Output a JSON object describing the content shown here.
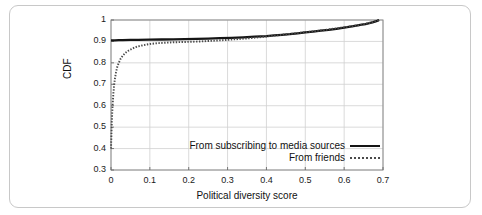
{
  "chart_data": {
    "type": "line",
    "title": "",
    "subtitle": "",
    "xlabel": "Political diversity score",
    "ylabel": "CDF",
    "xlim": [
      0,
      0.7
    ],
    "ylim": [
      0.3,
      1.0
    ],
    "grid": true,
    "legend_position": "inside-bottom-right",
    "xticks": [
      "0",
      "0.1",
      "0.2",
      "0.3",
      "0.4",
      "0.5",
      "0.6",
      "0.7"
    ],
    "xtick_values": [
      0,
      0.1,
      0.2,
      0.3,
      0.4,
      0.5,
      0.6,
      0.7
    ],
    "yticks": [
      "0.3",
      "0.4",
      "0.5",
      "0.6",
      "0.7",
      "0.8",
      "0.9",
      "1"
    ],
    "ytick_values": [
      0.3,
      0.4,
      0.5,
      0.6,
      0.7,
      0.8,
      0.9,
      1.0
    ],
    "series": [
      {
        "name": "From subscribing to media sources",
        "style": "solid",
        "color": "#151515",
        "x": [
          0.0,
          0.005,
          0.01,
          0.02,
          0.03,
          0.05,
          0.07,
          0.1,
          0.13,
          0.16,
          0.19,
          0.22,
          0.25,
          0.28,
          0.31,
          0.34,
          0.37,
          0.4,
          0.42,
          0.44,
          0.46,
          0.48,
          0.5,
          0.52,
          0.54,
          0.56,
          0.58,
          0.6,
          0.62,
          0.635,
          0.645,
          0.655,
          0.665,
          0.675,
          0.685,
          0.69
        ],
        "y": [
          0.905,
          0.905,
          0.905,
          0.906,
          0.906,
          0.907,
          0.907,
          0.908,
          0.909,
          0.91,
          0.911,
          0.912,
          0.913,
          0.915,
          0.917,
          0.919,
          0.922,
          0.925,
          0.928,
          0.931,
          0.934,
          0.938,
          0.942,
          0.946,
          0.95,
          0.954,
          0.959,
          0.964,
          0.97,
          0.975,
          0.978,
          0.981,
          0.985,
          0.99,
          0.996,
          1.0
        ]
      },
      {
        "name": "From friends",
        "style": "dotted",
        "color": "#4a4a4a",
        "x": [
          0.0,
          0.002,
          0.004,
          0.006,
          0.008,
          0.01,
          0.013,
          0.016,
          0.02,
          0.025,
          0.03,
          0.036,
          0.043,
          0.05,
          0.06,
          0.07,
          0.08,
          0.09,
          0.1,
          0.12,
          0.14,
          0.16,
          0.18,
          0.2,
          0.23,
          0.26,
          0.29,
          0.32,
          0.35,
          0.38,
          0.4,
          0.42,
          0.44,
          0.46,
          0.48,
          0.5,
          0.52,
          0.54,
          0.56,
          0.58,
          0.6,
          0.62,
          0.635,
          0.645,
          0.655,
          0.665,
          0.675,
          0.685,
          0.69
        ],
        "y": [
          0.4,
          0.52,
          0.6,
          0.655,
          0.695,
          0.725,
          0.757,
          0.78,
          0.8,
          0.82,
          0.833,
          0.845,
          0.855,
          0.862,
          0.871,
          0.877,
          0.881,
          0.885,
          0.888,
          0.892,
          0.894,
          0.896,
          0.897,
          0.898,
          0.9,
          0.903,
          0.906,
          0.91,
          0.914,
          0.919,
          0.923,
          0.927,
          0.931,
          0.935,
          0.939,
          0.943,
          0.947,
          0.951,
          0.956,
          0.961,
          0.966,
          0.971,
          0.975,
          0.978,
          0.982,
          0.986,
          0.991,
          0.996,
          1.0
        ]
      }
    ]
  },
  "legend": {
    "items": [
      {
        "label": "From subscribing to media sources",
        "style": "solid"
      },
      {
        "label": "From friends",
        "style": "dotted"
      }
    ]
  }
}
